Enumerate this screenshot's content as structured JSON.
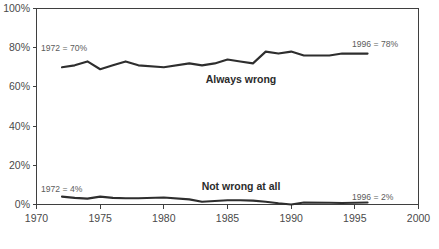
{
  "chart_data": {
    "type": "line",
    "title": "",
    "xlabel": "",
    "ylabel": "",
    "xlim": [
      1970,
      2000
    ],
    "ylim": [
      0,
      100
    ],
    "grid": false,
    "legend_position": "inline-annotation",
    "x_tick_labels": [
      "1970",
      "1975",
      "1980",
      "1985",
      "1990",
      "1995",
      "2000"
    ],
    "x_ticks": [
      1970,
      1975,
      1980,
      1985,
      1990,
      1995,
      2000
    ],
    "y_tick_labels": [
      "0%",
      "20%",
      "40%",
      "60%",
      "80%",
      "100%"
    ],
    "y_ticks": [
      0,
      20,
      40,
      60,
      80,
      100
    ],
    "x": [
      1972,
      1973,
      1974,
      1975,
      1976,
      1977,
      1978,
      1980,
      1982,
      1983,
      1984,
      1985,
      1986,
      1987,
      1988,
      1989,
      1990,
      1991,
      1993,
      1994,
      1996
    ],
    "series": [
      {
        "name": "Always wrong",
        "label": "Always wrong",
        "values": [
          70,
          71,
          73,
          69,
          71,
          73,
          71,
          70,
          72,
          71,
          72,
          74,
          73,
          72,
          78,
          77,
          78,
          76,
          76,
          77,
          77
        ],
        "start_annotation": "1972 = 70%",
        "end_annotation": "1996 = 78%"
      },
      {
        "name": "Not wrong at all",
        "label": "Not wrong at all",
        "values": [
          4,
          3.4,
          3,
          4,
          3.4,
          3.2,
          3.2,
          3.6,
          2.6,
          1.4,
          1.8,
          2.2,
          2.2,
          2,
          1.4,
          0.6,
          0,
          1,
          0.9,
          0.8,
          1
        ],
        "start_annotation": "1972 = 4%",
        "end_annotation": "1996 = 2%"
      }
    ],
    "annotations": [
      {
        "text": "1972 = 70%",
        "x": 1972,
        "y": 80,
        "name": "always-wrong-start-annotation"
      },
      {
        "text": "1996 = 78%",
        "x": 1996,
        "y": 82,
        "name": "always-wrong-end-annotation"
      },
      {
        "text": "1972 = 4%",
        "x": 1972,
        "y": 11,
        "name": "not-wrong-start-annotation"
      },
      {
        "text": "1996 = 2%",
        "x": 1996,
        "y": 7,
        "name": "not-wrong-end-annotation"
      },
      {
        "text": "Always wrong",
        "x": 1985,
        "y": 62,
        "name": "always-wrong-series-label"
      },
      {
        "text": "Not wrong at all",
        "x": 1985,
        "y": 12,
        "name": "not-wrong-series-label"
      }
    ],
    "colors": {
      "line": "#2e2e2e",
      "axis": "#3f3f3f",
      "tick_text": "#4a4a4a",
      "annotation_text": "#5c5c5c",
      "background": "#ffffff"
    }
  }
}
